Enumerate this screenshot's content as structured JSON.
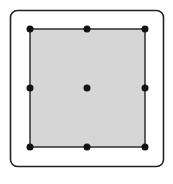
{
  "diagram": {
    "frame": {
      "x": 10.5,
      "y": 10.5,
      "width": 153,
      "height": 156,
      "radius": 7,
      "stroke": "#222222",
      "fill": "#ffffff"
    },
    "shape": {
      "x": 30,
      "y": 29,
      "width": 115,
      "height": 118,
      "fill": "#d6d6d6",
      "stroke": "#222222"
    },
    "handle_color": "#111111",
    "handle_radius": 3.5,
    "handles": [
      {
        "name": "top-left",
        "x": 30,
        "y": 29
      },
      {
        "name": "top-center",
        "x": 87,
        "y": 29
      },
      {
        "name": "top-right",
        "x": 145,
        "y": 29
      },
      {
        "name": "middle-left",
        "x": 30,
        "y": 88
      },
      {
        "name": "center",
        "x": 87,
        "y": 88
      },
      {
        "name": "middle-right",
        "x": 145,
        "y": 88
      },
      {
        "name": "bottom-left",
        "x": 30,
        "y": 147
      },
      {
        "name": "bottom-center",
        "x": 87,
        "y": 147
      },
      {
        "name": "bottom-right",
        "x": 145,
        "y": 147
      }
    ]
  }
}
